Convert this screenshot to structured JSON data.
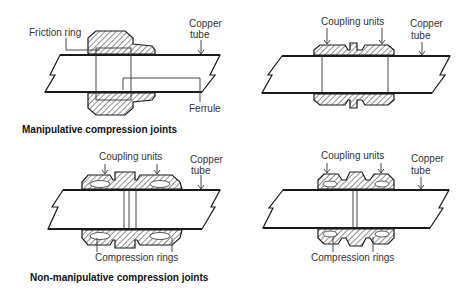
{
  "figure": {
    "panels": [
      {
        "id": "manipulative-left",
        "labels": {
          "friction_ring": "Friction ring",
          "copper_tube_1": "Copper",
          "copper_tube_2": "tube",
          "ferrule": "Ferrule"
        }
      },
      {
        "id": "manipulative-right",
        "labels": {
          "coupling_units": "Coupling units",
          "copper_tube_1": "Copper",
          "copper_tube_2": "tube"
        }
      },
      {
        "id": "non-manipulative-left",
        "labels": {
          "coupling_units": "Coupling units",
          "copper_tube_1": "Copper",
          "copper_tube_2": "tube",
          "compression_rings": "Compression rings"
        }
      },
      {
        "id": "non-manipulative-right",
        "labels": {
          "coupling_units": "Coupling units",
          "copper_tube_1": "Copper",
          "copper_tube_2": "tube",
          "compression_rings": "Compression rings"
        }
      }
    ],
    "captions": {
      "manipulative": "Manipulative compression joints",
      "non_manipulative": "Non-manipulative compression joints"
    },
    "colors": {
      "line": "#1a1a1a",
      "text": "#333333",
      "background": "#ffffff"
    }
  }
}
